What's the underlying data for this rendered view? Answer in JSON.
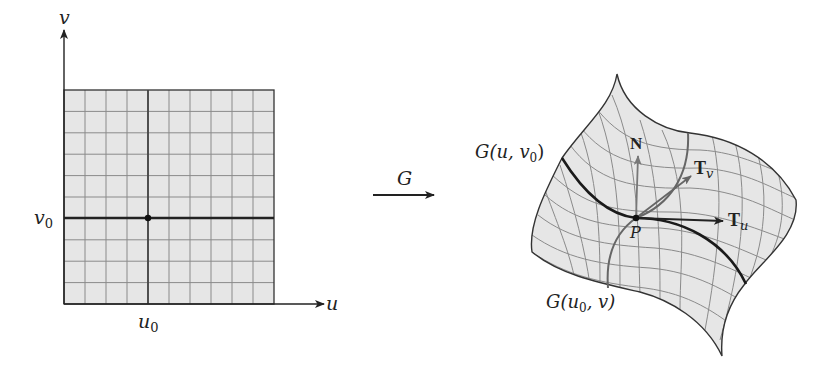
{
  "figure": {
    "domain_panel": {
      "axis_u_label": "u",
      "axis_v_label": "v",
      "tick_u0": "u",
      "tick_u0_sub": "0",
      "tick_v0": "v",
      "tick_v0_sub": "0",
      "grid_columns": 10,
      "grid_rows": 10,
      "u0_column_index": 4,
      "v0_row_index_from_top": 6,
      "grid_fill": "#e6e6e6",
      "grid_line_color": "#8a8a8a"
    },
    "map": {
      "label": "G"
    },
    "surface_panel": {
      "curve_u_label": "G(u, v",
      "curve_u_label_sub": "0",
      "curve_u_label_close": ")",
      "curve_v_label": "G(u",
      "curve_v_label_sub": "0",
      "curve_v_label_rest": ", v)",
      "point_label": "P",
      "normal_label": "N",
      "tangent_u_label": "T",
      "tangent_u_sub": "u",
      "tangent_v_label": "T",
      "tangent_v_sub": "v",
      "surface_fill": "#e6e6e6",
      "mesh_color": "#8a8a8a",
      "normal_color": "#777777",
      "tangent_v_color": "#666666",
      "tangent_u_color": "#222222"
    }
  }
}
